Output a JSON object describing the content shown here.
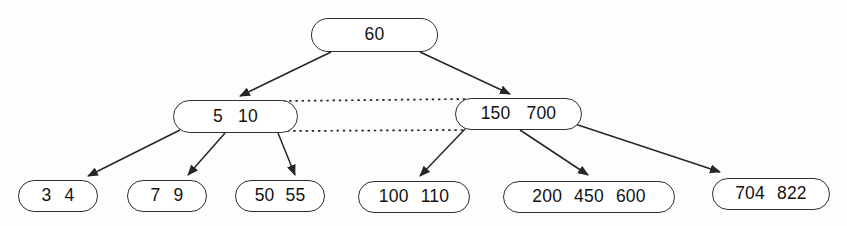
{
  "diagram": {
    "type": "tree",
    "colors": {
      "background": "#fdfdfd",
      "node_fill": "#ffffff",
      "node_border": "#2f2f2f",
      "edge": "#262626",
      "text": "#121212"
    },
    "nodes": [
      {
        "id": "60",
        "keys": [
          "60"
        ],
        "x": 311,
        "y": 18,
        "w": 127,
        "h": 34,
        "gap": 14
      },
      {
        "id": "5-10",
        "keys": [
          "5",
          "10"
        ],
        "x": 173,
        "y": 100,
        "w": 125,
        "h": 33,
        "gap": 15
      },
      {
        "id": "150-700",
        "keys": [
          "150",
          "700"
        ],
        "x": 455,
        "y": 98,
        "w": 127,
        "h": 32,
        "gap": 16
      },
      {
        "id": "3-4",
        "keys": [
          "3",
          "4"
        ],
        "x": 18,
        "y": 180,
        "w": 80,
        "h": 32,
        "gap": 13
      },
      {
        "id": "7-9",
        "keys": [
          "7",
          "9"
        ],
        "x": 127,
        "y": 180,
        "w": 80,
        "h": 32,
        "gap": 13
      },
      {
        "id": "50-55",
        "keys": [
          "50",
          "55"
        ],
        "x": 235,
        "y": 180,
        "w": 90,
        "h": 32,
        "gap": 11
      },
      {
        "id": "100-110",
        "keys": [
          "100",
          "110"
        ],
        "x": 358,
        "y": 181,
        "w": 112,
        "h": 32,
        "gap": 12
      },
      {
        "id": "200-450-600",
        "keys": [
          "200",
          "450",
          "600"
        ],
        "x": 503,
        "y": 181,
        "w": 172,
        "h": 32,
        "gap": 12
      },
      {
        "id": "704-822",
        "keys": [
          "704",
          "822"
        ],
        "x": 712,
        "y": 178,
        "w": 118,
        "h": 32,
        "gap": 12
      }
    ],
    "edges": [
      {
        "from": "60",
        "to": "5-10",
        "points": [
          [
            331,
            52
          ],
          [
            240,
            96
          ]
        ]
      },
      {
        "from": "60",
        "to": "150-700",
        "points": [
          [
            420,
            52
          ],
          [
            510,
            94
          ]
        ]
      },
      {
        "from": "5-10",
        "to": "3-4",
        "points": [
          [
            180,
            130
          ],
          [
            88,
            176
          ]
        ]
      },
      {
        "from": "5-10",
        "to": "7-9",
        "points": [
          [
            225,
            133
          ],
          [
            188,
            175
          ]
        ]
      },
      {
        "from": "5-10",
        "to": "50-55",
        "points": [
          [
            278,
            133
          ],
          [
            295,
            175
          ]
        ]
      },
      {
        "from": "150-700",
        "to": "100-110",
        "points": [
          [
            465,
            129
          ],
          [
            420,
            176
          ]
        ]
      },
      {
        "from": "150-700",
        "to": "200-450-600",
        "points": [
          [
            520,
            130
          ],
          [
            588,
            175
          ]
        ]
      },
      {
        "from": "150-700",
        "to": "704-822",
        "points": [
          [
            575,
            124
          ],
          [
            720,
            172
          ]
        ]
      }
    ],
    "dashed_links": [
      {
        "from": "5-10",
        "to": "150-700",
        "position": "top",
        "points": [
          [
            283,
            101
          ],
          [
            466,
            99
          ]
        ]
      },
      {
        "from": "5-10",
        "to": "150-700",
        "position": "bottom",
        "points": [
          [
            287,
            131
          ],
          [
            464,
            130
          ]
        ]
      }
    ]
  }
}
